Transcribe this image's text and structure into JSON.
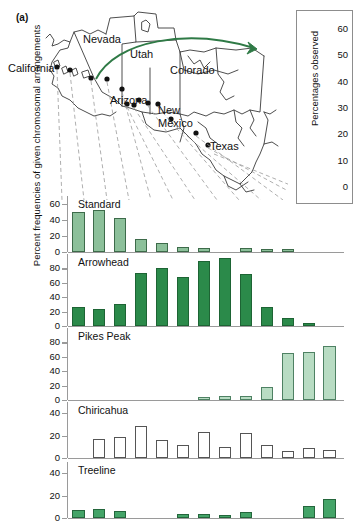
{
  "figure": {
    "panel_a_letter": "(a)",
    "panel_b_letter": "(b)"
  },
  "map": {
    "states": [
      {
        "name": "California"
      },
      {
        "name": "Nevada"
      },
      {
        "name": "Utah"
      },
      {
        "name": "Colorado"
      },
      {
        "name": "Arizona"
      },
      {
        "name": "New"
      },
      {
        "name": "Mexico"
      },
      {
        "name": "Texas"
      }
    ],
    "labels": {
      "california": "California",
      "nevada": "Nevada",
      "utah": "Utah",
      "colorado": "Colorado",
      "arizona": "Arizona",
      "new": "New",
      "mexico": "Mexico",
      "texas": "Texas"
    },
    "arrow_color": "#2f7a46",
    "site_count": 13
  },
  "panel_b": {
    "ylabel": "Percentages observed",
    "yticks": [
      "60",
      "50",
      "40",
      "30",
      "20",
      "10",
      "0"
    ],
    "ylim": [
      0,
      60
    ]
  },
  "main_ylabel": "Percent frequencies of given chromosomal arrangements",
  "chart_data": {
    "type": "bar",
    "title": "Percent frequencies of given chromosomal arrangements",
    "xlabel": "",
    "ylabel": "Percent frequencies of given chromosomal arrangements",
    "grid": false,
    "legend_position": "none",
    "categories": [
      "Site 1",
      "Site 2",
      "Site 3",
      "Site 4",
      "Site 5",
      "Site 6",
      "Site 7",
      "Site 8",
      "Site 9",
      "Site 10",
      "Site 11",
      "Site 12",
      "Site 13"
    ],
    "panels": [
      {
        "name": "Standard",
        "label": "Standard",
        "color": "#8cc09a",
        "ylim": [
          0,
          70
        ],
        "yticks": [
          0,
          20,
          40,
          60
        ],
        "ytick_labels": [
          "0",
          "20",
          "40",
          "60"
        ],
        "values": [
          50,
          53,
          43,
          16,
          11,
          6,
          5,
          0,
          5,
          4,
          4,
          0,
          0
        ]
      },
      {
        "name": "Arrowhead",
        "label": "Arrowhead",
        "color": "#2b8a4a",
        "ylim": [
          0,
          100
        ],
        "yticks": [
          0,
          20,
          40,
          60,
          80
        ],
        "ytick_labels": [
          "0",
          "20",
          "40",
          "60",
          "80"
        ],
        "values": [
          26,
          23,
          31,
          74,
          80,
          68,
          90,
          94,
          72,
          26,
          11,
          4,
          0
        ]
      },
      {
        "name": "Pikes Peak",
        "label": "Pikes Peak",
        "color": "#b8dcc3",
        "ylim": [
          0,
          100
        ],
        "yticks": [
          0,
          20,
          40,
          60,
          80
        ],
        "ytick_labels": [
          "0",
          "20",
          "40",
          "60",
          "80"
        ],
        "values": [
          0,
          0,
          0,
          0,
          0,
          0,
          4,
          6,
          5,
          18,
          65,
          66,
          75
        ]
      },
      {
        "name": "Chiricahua",
        "label": "Chiricahua",
        "color": "#ffffff",
        "ylim": [
          0,
          50
        ],
        "yticks": [
          0,
          20,
          40
        ],
        "ytick_labels": [
          "0",
          "20",
          "40"
        ],
        "values": [
          0,
          17,
          19,
          29,
          16,
          12,
          23,
          10,
          22,
          12,
          6,
          9,
          7
        ]
      },
      {
        "name": "Treeline",
        "label": "Treeline",
        "color": "#44a468",
        "ylim": [
          0,
          50
        ],
        "yticks": [
          0,
          20,
          40
        ],
        "ytick_labels": [
          "0",
          "20",
          "40"
        ],
        "values": [
          7,
          8,
          6,
          0,
          0,
          4,
          4,
          3,
          5,
          0,
          0,
          11,
          17
        ]
      }
    ]
  }
}
